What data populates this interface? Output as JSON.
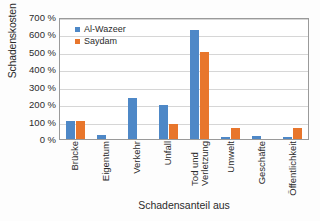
{
  "chart_data": {
    "type": "bar",
    "title": "",
    "xlabel": "Schadensanteil aus",
    "ylabel": "Schadenskosten normiert",
    "categories": [
      "Brücke",
      "Eigentum",
      "Verkehr",
      "Unfall",
      "Tod und Verletzung",
      "Umwelt",
      "Geschäfte",
      "Öffentlichkeit"
    ],
    "categories_lines": [
      [
        "Brücke"
      ],
      [
        "Eigentum"
      ],
      [
        "Verkehr"
      ],
      [
        "Unfall"
      ],
      [
        "Tod und",
        "Verletzung"
      ],
      [
        "Umwelt"
      ],
      [
        "Geschäfte"
      ],
      [
        "Öffentlichkeit"
      ]
    ],
    "series": [
      {
        "name": "Al-Wazeer",
        "color": "#4e88c7",
        "values": [
          103,
          22,
          237,
          196,
          625,
          10,
          15,
          12
        ]
      },
      {
        "name": "Saydam",
        "color": "#e8762c",
        "values": [
          103,
          0,
          0,
          85,
          500,
          65,
          0,
          62
        ]
      }
    ],
    "ylim": [
      0,
      700
    ],
    "ytick_values": [
      0,
      100,
      200,
      300,
      400,
      500,
      600,
      700
    ],
    "ytick_labels": [
      "0 %",
      "100 %",
      "200 %",
      "300 %",
      "400 %",
      "500 %",
      "600 %",
      "700 %"
    ],
    "grid": true,
    "grid_axis": "y",
    "legend_position": "top-left-inside",
    "legend": [
      "Al-Wazeer",
      "Saydam"
    ],
    "units": "%"
  }
}
